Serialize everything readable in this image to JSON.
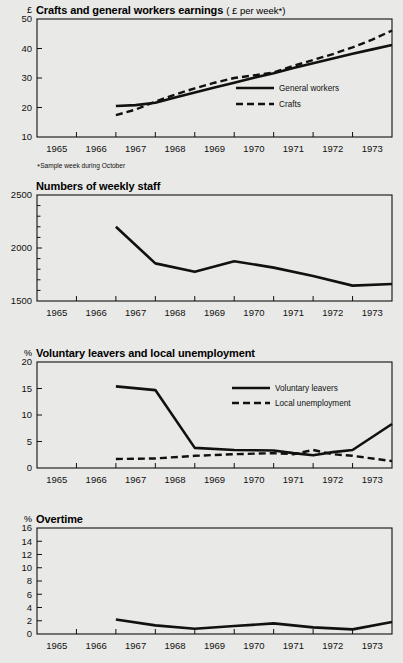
{
  "figure": {
    "background_color": "#e9e9e7",
    "line_color": "#111111",
    "x_axis": {
      "tick_labels": [
        "1965",
        "1966",
        "1967",
        "1968",
        "1969",
        "1970",
        "1971",
        "1972",
        "1973"
      ],
      "range": [
        1964.5,
        1973.5
      ]
    }
  },
  "panels": [
    {
      "key": "earnings",
      "unit": "£",
      "title": "Crafts and general workers earnings",
      "subtitle": "( £ per week*)",
      "footnote": "Sample week during October",
      "footnote_marker": "*"
    },
    {
      "key": "weekly_staff",
      "unit": "",
      "title": "Numbers of weekly staff",
      "subtitle": ""
    },
    {
      "key": "leavers",
      "unit": "%",
      "title": "Voluntary leavers and local unemployment",
      "subtitle": ""
    },
    {
      "key": "overtime",
      "unit": "%",
      "title": "Overtime",
      "subtitle": ""
    }
  ],
  "chart_data": [
    {
      "type": "line",
      "title": "Crafts and general workers earnings ( £ per week*)",
      "xlabel": "",
      "ylabel": "£",
      "ylim": [
        10,
        50
      ],
      "yticks": [
        10,
        20,
        30,
        40,
        50
      ],
      "xlim": [
        1964.5,
        1973.5
      ],
      "xticks": [
        1965,
        1966,
        1967,
        1968,
        1969,
        1970,
        1971,
        1972,
        1973
      ],
      "grid": false,
      "legend": "inside-right",
      "note": "Sample week during October",
      "series": [
        {
          "name": "General workers",
          "style": "solid",
          "x": [
            1966.5,
            1967.0,
            1967.5,
            1968.0,
            1968.5,
            1969.0,
            1969.5,
            1970.0,
            1970.5,
            1971.0,
            1971.5,
            1972.0,
            1972.5,
            1973.0,
            1973.5
          ],
          "values": [
            20.5,
            20.8,
            21.6,
            23.4,
            25.1,
            26.8,
            28.4,
            30.1,
            31.6,
            33.4,
            35.0,
            36.6,
            38.2,
            39.7,
            41.2
          ]
        },
        {
          "name": "Crafts",
          "style": "dashed",
          "x": [
            1966.5,
            1967.0,
            1967.5,
            1968.0,
            1968.5,
            1969.0,
            1969.5,
            1970.0,
            1970.5,
            1971.0,
            1971.5,
            1972.0,
            1972.5,
            1973.0,
            1973.5
          ],
          "values": [
            17.4,
            19.3,
            22.0,
            24.4,
            26.5,
            28.4,
            30.0,
            30.9,
            31.9,
            34.1,
            36.1,
            38.1,
            40.4,
            43.0,
            46.1
          ]
        }
      ]
    },
    {
      "type": "line",
      "title": "Numbers of weekly staff",
      "xlabel": "",
      "ylabel": "",
      "ylim": [
        1500,
        2500
      ],
      "yticks": [
        1500,
        2000,
        2500
      ],
      "yticks_minor": [
        1600,
        1700,
        1800,
        1900,
        2100,
        2200,
        2300,
        2400
      ],
      "xlim": [
        1964.5,
        1973.5
      ],
      "xticks": [
        1965,
        1966,
        1967,
        1968,
        1969,
        1970,
        1971,
        1972,
        1973
      ],
      "grid": false,
      "series": [
        {
          "name": "Numbers of weekly staff",
          "style": "solid",
          "x": [
            1966.5,
            1967.5,
            1968.5,
            1969.5,
            1970.5,
            1971.5,
            1972.5,
            1973.5
          ],
          "values": [
            2200,
            1855,
            1775,
            1875,
            1815,
            1735,
            1645,
            1660
          ]
        }
      ]
    },
    {
      "type": "line",
      "title": "Voluntary leavers and local unemployment",
      "xlabel": "",
      "ylabel": "%",
      "ylim": [
        0,
        20
      ],
      "yticks": [
        0,
        5,
        10,
        15,
        20
      ],
      "xlim": [
        1964.5,
        1973.5
      ],
      "xticks": [
        1965,
        1966,
        1967,
        1968,
        1969,
        1970,
        1971,
        1972,
        1973
      ],
      "grid": false,
      "legend": "inside-right",
      "series": [
        {
          "name": "Voluntary leavers",
          "style": "solid",
          "x": [
            1966.5,
            1967.5,
            1968.5,
            1969.5,
            1970.5,
            1971.0,
            1971.5,
            1972.0,
            1972.5,
            1973.5
          ],
          "values": [
            15.4,
            14.7,
            3.8,
            3.4,
            3.3,
            2.8,
            2.4,
            3.0,
            3.4,
            8.3
          ]
        },
        {
          "name": "Local unemployment",
          "style": "dashed",
          "x": [
            1966.5,
            1967.5,
            1968.5,
            1969.5,
            1970.5,
            1971.0,
            1971.5,
            1972.0,
            1972.5,
            1973.5
          ],
          "values": [
            1.7,
            1.8,
            2.3,
            2.6,
            2.8,
            2.6,
            3.4,
            2.6,
            2.3,
            1.3
          ]
        }
      ]
    },
    {
      "type": "line",
      "title": "Overtime",
      "xlabel": "",
      "ylabel": "%",
      "ylim": [
        0,
        16
      ],
      "yticks": [
        0,
        2,
        4,
        6,
        8,
        10,
        12,
        14,
        16
      ],
      "xlim": [
        1964.5,
        1973.5
      ],
      "xticks": [
        1965,
        1966,
        1967,
        1968,
        1969,
        1970,
        1971,
        1972,
        1973
      ],
      "grid": false,
      "series": [
        {
          "name": "Overtime",
          "style": "solid",
          "x": [
            1966.5,
            1967.5,
            1968.5,
            1969.5,
            1970.5,
            1971.5,
            1972.5,
            1973.5
          ],
          "values": [
            2.2,
            1.3,
            0.8,
            1.2,
            1.6,
            1.0,
            0.7,
            1.8
          ]
        }
      ]
    }
  ],
  "legends": {
    "earnings": [
      {
        "label": "General workers",
        "style": "solid"
      },
      {
        "label": "Crafts",
        "style": "dashed"
      }
    ],
    "leavers": [
      {
        "label": "Voluntary  leavers",
        "style": "solid"
      },
      {
        "label": "Local unemployment",
        "style": "dashed"
      }
    ]
  }
}
